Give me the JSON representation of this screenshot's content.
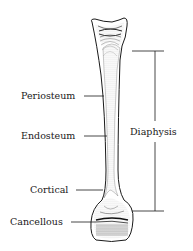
{
  "diagram": {
    "labels": {
      "periosteum": "Periosteum",
      "endosteum": "Endosteum",
      "cortical": "Cortical",
      "cancellous": "Cancellous",
      "diaphysis": "Diaphysis"
    },
    "colors": {
      "line": "#1a1a1a",
      "background": "#ffffff",
      "stipple": "#555555"
    }
  }
}
